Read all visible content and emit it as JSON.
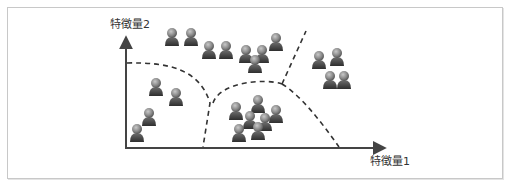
{
  "diagram": {
    "y_axis_label": "特徴量2",
    "x_axis_label": "特徴量1",
    "axis_color": "#444444",
    "boundary_color": "#333333",
    "person_icon": "person-icon",
    "clusters": [
      {
        "name": "left-cluster",
        "points": [
          [
            156,
            87
          ],
          [
            176,
            97
          ],
          [
            149,
            117
          ],
          [
            137,
            133
          ]
        ]
      },
      {
        "name": "top-cluster",
        "points": [
          [
            172,
            37
          ],
          [
            191,
            37
          ],
          [
            209,
            50
          ],
          [
            226,
            50
          ],
          [
            246,
            54
          ],
          [
            262,
            54
          ],
          [
            255,
            64
          ],
          [
            276,
            42
          ]
        ]
      },
      {
        "name": "bottom-middle-cluster",
        "points": [
          [
            236,
            111
          ],
          [
            258,
            104
          ],
          [
            250,
            120
          ],
          [
            265,
            122
          ],
          [
            276,
            114
          ],
          [
            239,
            133
          ],
          [
            258,
            131
          ]
        ]
      },
      {
        "name": "right-cluster",
        "points": [
          [
            319,
            60
          ],
          [
            337,
            57
          ],
          [
            330,
            80
          ],
          [
            344,
            80
          ]
        ]
      }
    ]
  }
}
